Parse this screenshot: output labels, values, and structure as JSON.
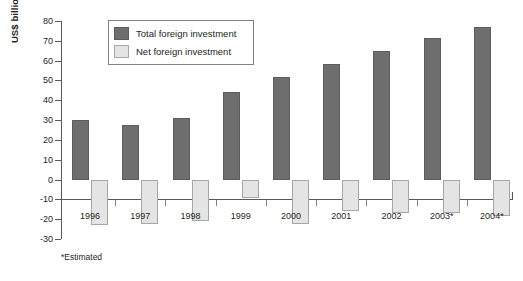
{
  "chart_data": {
    "type": "bar",
    "title": "",
    "xlabel": "",
    "ylabel": "US$ billion",
    "ylim": [
      -30,
      80
    ],
    "ytick_step": 10,
    "grid": false,
    "legend_position": "top-left-inside",
    "categories": [
      "1996",
      "1997",
      "1998",
      "1999",
      "2000",
      "2001",
      "2002",
      "2003*",
      "2004*"
    ],
    "yticks": [
      "80",
      "70",
      "60",
      "50",
      "40",
      "30",
      "20",
      "10",
      "0",
      "-10",
      "-20",
      "-30"
    ],
    "series": [
      {
        "name": "Total foreign investment",
        "color": "#6e6e6e",
        "values": [
          30,
          27.5,
          31,
          44,
          51.5,
          58.5,
          65,
          71.5,
          77
        ]
      },
      {
        "name": "Net foreign investment",
        "color": "#e4e4e4",
        "values": [
          -23,
          -22.5,
          -21,
          -9.5,
          -22.5,
          -16,
          -17,
          -17,
          -18.5
        ]
      }
    ],
    "annotations": [
      "*Estimated"
    ]
  },
  "legend": {
    "items": [
      {
        "label": "Total foreign investment",
        "swatch": "total"
      },
      {
        "label": "Net foreign investment",
        "swatch": "net"
      }
    ]
  },
  "footnote": "*Estimated",
  "colors": {
    "total_bar": "#6e6e6e",
    "net_bar": "#e4e4e4",
    "axis": "#58595b",
    "text": "#231f20",
    "background": "#ffffff"
  }
}
